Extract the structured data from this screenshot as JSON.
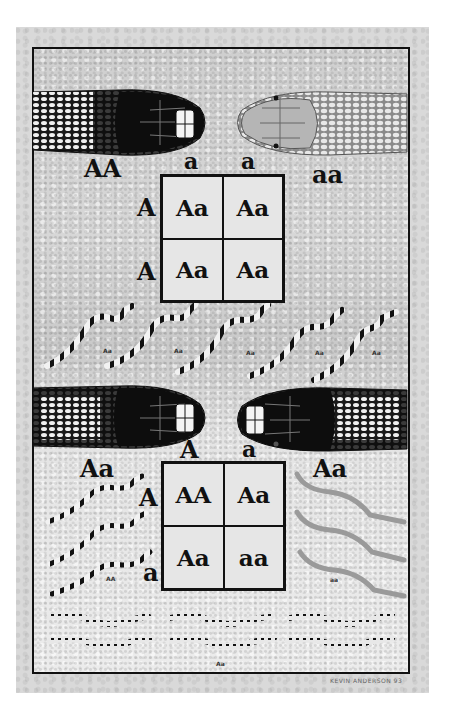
{
  "colors": {
    "paper": "#d9d9d9",
    "frame_border": "#111111",
    "grid_fill": "#e6e6e6",
    "text": "#111111"
  },
  "cross1": {
    "parent_left": {
      "genotype": "AA",
      "appearance": "banded dark snake head"
    },
    "parent_right": {
      "genotype": "aa",
      "appearance": "light plain snake head"
    },
    "column_alleles": [
      "a",
      "a"
    ],
    "row_alleles": [
      "A",
      "A"
    ],
    "cells": [
      [
        "Aa",
        "Aa"
      ],
      [
        "Aa",
        "Aa"
      ]
    ],
    "offspring": {
      "count": 5,
      "labels": [
        "Aa",
        "Aa",
        "Aa",
        "Aa",
        "Aa"
      ]
    }
  },
  "cross2": {
    "parent_left": {
      "genotype": "Aa",
      "appearance": "banded dark snake head"
    },
    "parent_right": {
      "genotype": "Aa",
      "appearance": "banded dark snake head"
    },
    "column_alleles": [
      "A",
      "a"
    ],
    "row_alleles": [
      "A",
      "a"
    ],
    "cells": [
      [
        "AA",
        "Aa"
      ],
      [
        "Aa",
        "aa"
      ]
    ],
    "offspring_left": {
      "count": 3,
      "label": "AA"
    },
    "offspring_right": {
      "count": 3,
      "label": "aa"
    },
    "offspring_bottom": {
      "count": 6,
      "label": "Aa"
    }
  },
  "signature": "KEVIN ANDERSON 93"
}
